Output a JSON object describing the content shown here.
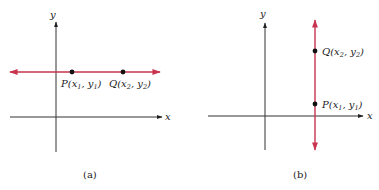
{
  "panels": [
    {
      "caption": "(a)",
      "axes": {
        "x_label": "x",
        "y_label": "y"
      },
      "line": {
        "orientation": "horizontal",
        "color": "#c8344f"
      },
      "points": [
        {
          "name": "P",
          "label_prefix": "P(x",
          "sub1": "1",
          "mid": ", y",
          "sub2": "1",
          "suffix": ")"
        },
        {
          "name": "Q",
          "label_prefix": "Q(x",
          "sub1": "2",
          "mid": ", y",
          "sub2": "2",
          "suffix": ")"
        }
      ]
    },
    {
      "caption": "(b)",
      "axes": {
        "x_label": "x",
        "y_label": "y"
      },
      "line": {
        "orientation": "vertical",
        "color": "#c8344f"
      },
      "points": [
        {
          "name": "Q",
          "label_prefix": "Q(x",
          "sub1": "2",
          "mid": ", y",
          "sub2": "2",
          "suffix": ")"
        },
        {
          "name": "P",
          "label_prefix": "P(x",
          "sub1": "1",
          "mid": ", y",
          "sub2": "1",
          "suffix": ")"
        }
      ]
    }
  ]
}
